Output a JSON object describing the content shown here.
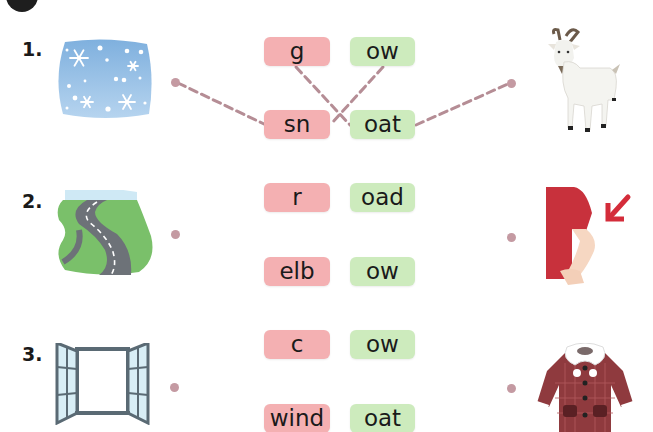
{
  "header": {
    "badge_color": "#1e1e1e"
  },
  "colors": {
    "left_syllable_bg": "#f4b0b2",
    "right_syllable_bg": "#cdebbd",
    "dot_and_line": "#c49aa2"
  },
  "rows": [
    {
      "number": "1.",
      "left_picture": "snow-icon",
      "syllables_left": [
        "g",
        "sn"
      ],
      "syllables_right": [
        "ow",
        "oat"
      ],
      "right_picture": "goat-icon"
    },
    {
      "number": "2.",
      "left_picture": "road-icon",
      "syllables_left": [
        "r",
        "elb"
      ],
      "syllables_right": [
        "oad",
        "ow"
      ],
      "right_picture": "elbow-icon"
    },
    {
      "number": "3.",
      "left_picture": "window-icon",
      "syllables_left": [
        "c",
        "wind"
      ],
      "syllables_right": [
        "ow",
        "oat"
      ],
      "right_picture": "coat-icon"
    }
  ],
  "example_connections": [
    {
      "from": "snow-picture",
      "to": "sn"
    },
    {
      "from": "g",
      "to": "oat"
    },
    {
      "from": "ow",
      "to": "sn"
    },
    {
      "from": "oat",
      "to": "goat-picture"
    }
  ]
}
